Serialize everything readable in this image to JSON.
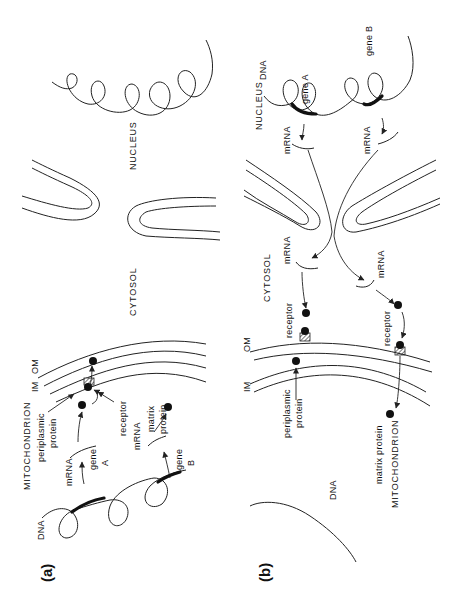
{
  "figure": {
    "orientation": "rotated 90 degrees counter-clockwise",
    "panels": [
      {
        "id": "a",
        "label": "(a)",
        "compartments": {
          "nucleus": "NUCLEUS",
          "cytosol": "CYTOSOL",
          "mitochondrion": "MITOCHONDRION"
        },
        "labels": {
          "dna": "DNA",
          "gene_a": "gene A",
          "gene_a_line1": "gene",
          "gene_a_line2": "A",
          "gene_b_line1": "gene",
          "gene_b_line2": "B",
          "mrna_a": "mRNA",
          "mrna_b": "mRNA",
          "periplasmic_line1": "periplasmic",
          "periplasmic_line2": "protein",
          "matrix_line1": "matrix",
          "matrix_line2": "protein",
          "receptor": "receptor",
          "im": "IM",
          "om": "OM"
        }
      },
      {
        "id": "b",
        "label": "(b)",
        "compartments": {
          "nucleus": "NUCLEUS",
          "cytosol": "CYTOSOL",
          "mitochondrion": "MITOCHONDRION"
        },
        "labels": {
          "dna_nucleus": "DNA",
          "dna_mito": "DNA",
          "gene_a": "gene  A",
          "gene_b": "gene  B",
          "mrna_nuc_a": "mRNA",
          "mrna_nuc_b": "mRNA",
          "mrna_cyto_a": "mRNA",
          "mrna_cyto_b": "mRNA",
          "receptor_a": "receptor",
          "receptor_b": "receptor",
          "periplasmic_line1": "periplasmic",
          "periplasmic_line2": "protein",
          "matrix": "matrix  protein",
          "im": "IM",
          "om": "OM"
        }
      }
    ]
  }
}
